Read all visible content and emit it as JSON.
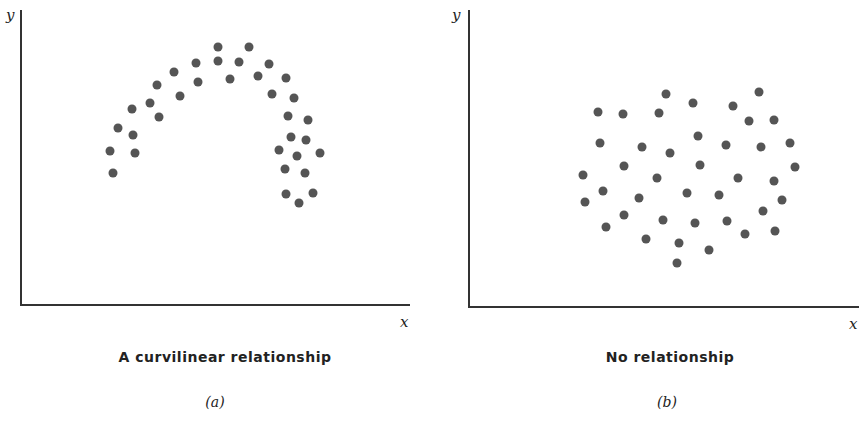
{
  "chart_data": [
    {
      "type": "scatter",
      "id": "a",
      "title": "A curvilinear relationship",
      "subtitle": "(a)",
      "xlabel": "x",
      "ylabel": "y",
      "grid": false,
      "axes": {
        "origin": [
          21,
          305
        ],
        "x_end": 410,
        "y_top": 10
      },
      "points_px": [
        [
          110,
          151
        ],
        [
          113,
          173
        ],
        [
          118,
          128
        ],
        [
          132,
          109
        ],
        [
          133,
          135
        ],
        [
          135,
          153
        ],
        [
          150,
          103
        ],
        [
          157,
          85
        ],
        [
          159,
          117
        ],
        [
          174,
          72
        ],
        [
          180,
          96
        ],
        [
          196,
          63
        ],
        [
          198,
          82
        ],
        [
          218,
          47
        ],
        [
          218,
          61
        ],
        [
          230,
          79
        ],
        [
          239,
          62
        ],
        [
          249,
          47
        ],
        [
          258,
          76
        ],
        [
          269,
          64
        ],
        [
          272,
          94
        ],
        [
          286,
          78
        ],
        [
          288,
          116
        ],
        [
          294,
          98
        ],
        [
          279,
          150
        ],
        [
          291,
          137
        ],
        [
          297,
          156
        ],
        [
          306,
          140
        ],
        [
          308,
          120
        ],
        [
          320,
          153
        ],
        [
          285,
          169
        ],
        [
          305,
          173
        ],
        [
          286,
          194
        ],
        [
          299,
          203
        ],
        [
          313,
          193
        ]
      ]
    },
    {
      "type": "scatter",
      "id": "b",
      "title": "No relationship",
      "subtitle": "(b)",
      "xlabel": "x",
      "ylabel": "y",
      "grid": false,
      "axes": {
        "origin": [
          469,
          307
        ],
        "x_end": 859,
        "y_top": 10
      },
      "points_px": [
        [
          666,
          94
        ],
        [
          759,
          92
        ],
        [
          693,
          103
        ],
        [
          733,
          106
        ],
        [
          598,
          112
        ],
        [
          623,
          114
        ],
        [
          659,
          113
        ],
        [
          749,
          121
        ],
        [
          774,
          120
        ],
        [
          698,
          136
        ],
        [
          600,
          143
        ],
        [
          642,
          147
        ],
        [
          670,
          153
        ],
        [
          726,
          145
        ],
        [
          761,
          147
        ],
        [
          790,
          143
        ],
        [
          624,
          166
        ],
        [
          700,
          165
        ],
        [
          795,
          167
        ],
        [
          583,
          175
        ],
        [
          657,
          178
        ],
        [
          738,
          178
        ],
        [
          774,
          181
        ],
        [
          603,
          191
        ],
        [
          639,
          198
        ],
        [
          687,
          193
        ],
        [
          719,
          195
        ],
        [
          782,
          200
        ],
        [
          585,
          202
        ],
        [
          624,
          215
        ],
        [
          663,
          220
        ],
        [
          695,
          223
        ],
        [
          727,
          221
        ],
        [
          763,
          211
        ],
        [
          606,
          227
        ],
        [
          646,
          239
        ],
        [
          679,
          243
        ],
        [
          745,
          234
        ],
        [
          775,
          231
        ],
        [
          709,
          250
        ],
        [
          677,
          263
        ]
      ]
    }
  ],
  "panels": {
    "a": {
      "title": "A curvilinear relationship",
      "subtitle": "(a)",
      "xlabel": "x",
      "ylabel": "y"
    },
    "b": {
      "title": "No relationship",
      "subtitle": "(b)",
      "xlabel": "x",
      "ylabel": "y"
    }
  },
  "colors": {
    "dot": "#555555",
    "axis": "#333333",
    "text": "#222222"
  }
}
